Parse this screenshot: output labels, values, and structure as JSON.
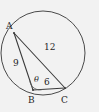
{
  "figure": {
    "type": "geometry-diagram",
    "background_color": "#f2f2f2",
    "stroke_color": "#4a4a4a",
    "text_color": "#262626",
    "width": 99,
    "height": 112
  },
  "circle": {
    "name": "circumcircle",
    "center_x": 43,
    "center_y": 53,
    "radius": 42
  },
  "vertices": [
    {
      "label": "A",
      "x": 14,
      "y": 33
    },
    {
      "label": "B",
      "x": 33,
      "y": 90
    },
    {
      "label": "C",
      "x": 65,
      "y": 88
    }
  ],
  "sides": [
    {
      "name": "AB",
      "label": "9",
      "from": "A",
      "to": "B"
    },
    {
      "name": "AC",
      "label": "12",
      "from": "A",
      "to": "C"
    },
    {
      "name": "BC",
      "label": "6",
      "from": "B",
      "to": "C"
    }
  ],
  "angles": [
    {
      "name": "angle-at-B",
      "label": "θ",
      "vertex": "B"
    }
  ],
  "labels": {
    "vertex_a": "A",
    "vertex_b": "B",
    "vertex_c": "C",
    "side_ab": "9",
    "side_ac": "12",
    "side_bc": "6",
    "angle_theta": "θ"
  }
}
